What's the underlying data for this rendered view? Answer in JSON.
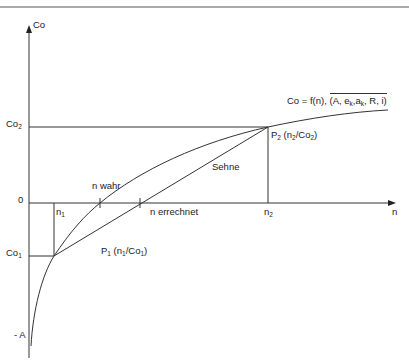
{
  "diagram": {
    "type": "function-plot-with-secant",
    "colors": {
      "line": "#333333",
      "background": "#ffffff",
      "text": "#1a1a1a"
    },
    "axes": {
      "y_label": "Co",
      "x_label": "n",
      "origin_label": "0"
    },
    "y_ticks": {
      "co2": {
        "base": "Co",
        "sub": "2"
      },
      "co1": {
        "base": "Co",
        "sub": "1"
      },
      "minus_a": "- A"
    },
    "x_ticks": {
      "n1": {
        "base": "n",
        "sub": "1"
      },
      "n2": {
        "base": "n",
        "sub": "2"
      }
    },
    "labels": {
      "n_wahr": "n wahr",
      "n_errechnet": "n errechnet",
      "sehne": "Sehne",
      "function_lhs": "Co = f(n), ",
      "function_params": "(A, e",
      "function_params_sub1": "k",
      "function_params_mid": ",a",
      "function_params_sub2": "k",
      "function_params_end": ", R, i)"
    },
    "points": {
      "p1": {
        "name": "P",
        "name_sub": "1",
        "coord_open": " (n",
        "coord_sub1": "1",
        "coord_mid": "/Co",
        "coord_sub2": "1",
        "coord_close": ")"
      },
      "p2": {
        "name": "P",
        "name_sub": "2",
        "coord_open": " (n",
        "coord_sub1": "2",
        "coord_mid": "/Co",
        "coord_sub2": "2",
        "coord_close": ")"
      }
    }
  }
}
